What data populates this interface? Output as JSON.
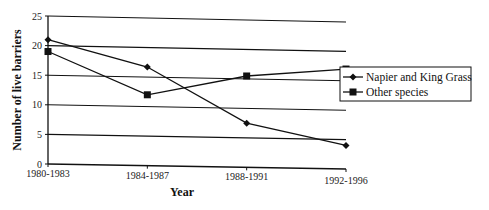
{
  "chart_data": {
    "type": "line",
    "title": "",
    "xlabel": "Year",
    "ylabel": "Number of live barriers",
    "categories": [
      "1980-1983",
      "1984-1987",
      "1988-1991",
      "1992-1996"
    ],
    "series": [
      {
        "name": "Napier and King Grass",
        "marker": "diamond",
        "values": [
          21,
          16.7,
          7.5,
          4
        ]
      },
      {
        "name": "Other species",
        "marker": "square",
        "values": [
          19,
          12,
          15.5,
          17
        ]
      }
    ],
    "ylim": [
      0,
      25
    ],
    "yticks": [
      "0",
      "5",
      "10",
      "15",
      "20",
      "25"
    ],
    "grid": true,
    "legend_position": "right"
  },
  "colors": {
    "line": "#111111",
    "grid": "#111111",
    "background": "#ffffff"
  }
}
